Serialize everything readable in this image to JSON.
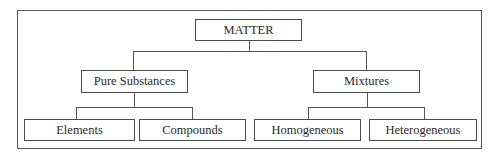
{
  "diagram": {
    "type": "hierarchy",
    "root": {
      "label": "MATTER",
      "children": [
        {
          "label": "Pure Substances",
          "children": [
            {
              "label": "Elements"
            },
            {
              "label": "Compounds"
            }
          ]
        },
        {
          "label": "Mixtures",
          "children": [
            {
              "label": "Homogeneous"
            },
            {
              "label": "Heterogeneous"
            }
          ]
        }
      ]
    }
  },
  "colors": {
    "background": "#ffffff",
    "border": "#4a4a4a",
    "text": "#2a2a2a"
  }
}
